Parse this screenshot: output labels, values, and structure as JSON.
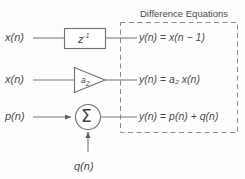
{
  "figure": {
    "title": "Difference Equations",
    "line_color": "#7a7a7a",
    "text_color": "#4a4a4a",
    "background_color": "#fdfdfd",
    "dashed_box_color": "#8a8a8a"
  },
  "rows": [
    {
      "input_label": "x(n)",
      "block_type": "delay-block",
      "block_label_base": "z",
      "block_label_exponent": "-1",
      "equation_lhs": "y(n)",
      "equation_eq": "=",
      "equation_rhs": "x(n − 1)",
      "equation_full": "y(n) = x(n − 1)"
    },
    {
      "input_label": "x(n)",
      "block_type": "gain-triangle",
      "block_label_base": "a",
      "block_label_subscript": "2",
      "equation_lhs": "y(n)",
      "equation_eq": "=",
      "equation_rhs": "a₂ x(n)",
      "equation_rhs_base": "a",
      "equation_rhs_sub": "2",
      "equation_rhs_tail": " x(n)",
      "equation_full": "y(n) = a₂ x(n)"
    },
    {
      "input_label": "p(n)",
      "block_type": "summing-junction",
      "block_label_base": "Σ",
      "second_input_label": "q(n)",
      "equation_lhs": "y(n)",
      "equation_eq": "=",
      "equation_rhs": "p(n) + q(n)",
      "equation_full": "y(n) = p(n) + q(n)"
    }
  ]
}
